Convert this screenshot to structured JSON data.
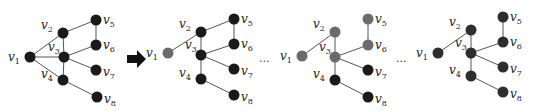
{
  "colors": {
    "black": "#1a1a1a",
    "dark": "#2e2e2e",
    "gray": "#6b6b6b",
    "edge": "#555555"
  },
  "labels": {
    "v1": "1",
    "v2": "2",
    "v3": "3",
    "v4": "4",
    "v5": "5",
    "v6": "6",
    "v7": "7",
    "v8": "8",
    "base": "v"
  },
  "ellipsis": [
    "...",
    "..."
  ],
  "arrow": "right-arrow",
  "panels": [
    {
      "name": "initial-graph",
      "nodes": {
        "v1": {
          "x": 30,
          "y": 57,
          "c": "black"
        },
        "v2": {
          "x": 63,
          "y": 33,
          "c": "black"
        },
        "v3": {
          "x": 64,
          "y": 57,
          "c": "black"
        },
        "v4": {
          "x": 63,
          "y": 80,
          "c": "black"
        },
        "v5": {
          "x": 96,
          "y": 20,
          "c": "black"
        },
        "v6": {
          "x": 96,
          "y": 45,
          "c": "black"
        },
        "v7": {
          "x": 96,
          "y": 70,
          "c": "black"
        },
        "v8": {
          "x": 97,
          "y": 97,
          "c": "black"
        }
      },
      "edges": [
        [
          "v1",
          "v2"
        ],
        [
          "v1",
          "v3"
        ],
        [
          "v1",
          "v4"
        ],
        [
          "v2",
          "v5"
        ],
        [
          "v2",
          "v3"
        ],
        [
          "v3",
          "v6"
        ],
        [
          "v5",
          "v6"
        ],
        [
          "v3",
          "v7"
        ],
        [
          "v3",
          "v4"
        ],
        [
          "v4",
          "v8"
        ]
      ]
    },
    {
      "name": "tree-step-1",
      "nodes": {
        "v1": {
          "x": 168,
          "y": 53,
          "c": "gray"
        },
        "v2": {
          "x": 201,
          "y": 32,
          "c": "black"
        },
        "v3": {
          "x": 201,
          "y": 55,
          "c": "black"
        },
        "v4": {
          "x": 201,
          "y": 79,
          "c": "black"
        },
        "v5": {
          "x": 234,
          "y": 19,
          "c": "black"
        },
        "v6": {
          "x": 234,
          "y": 44,
          "c": "black"
        },
        "v7": {
          "x": 234,
          "y": 69,
          "c": "black"
        },
        "v8": {
          "x": 234,
          "y": 95,
          "c": "black"
        }
      },
      "edges": [
        [
          "v1",
          "v2"
        ],
        [
          "v2",
          "v5"
        ],
        [
          "v2",
          "v3"
        ],
        [
          "v3",
          "v6"
        ],
        [
          "v5",
          "v6"
        ],
        [
          "v3",
          "v7"
        ],
        [
          "v3",
          "v4"
        ],
        [
          "v4",
          "v8"
        ]
      ]
    },
    {
      "name": "tree-step-k",
      "nodes": {
        "v1": {
          "x": 302,
          "y": 56,
          "c": "gray"
        },
        "v2": {
          "x": 335,
          "y": 32,
          "c": "gray"
        },
        "v3": {
          "x": 335,
          "y": 57,
          "c": "gray"
        },
        "v4": {
          "x": 335,
          "y": 80,
          "c": "black"
        },
        "v5": {
          "x": 368,
          "y": 19,
          "c": "gray"
        },
        "v6": {
          "x": 368,
          "y": 45,
          "c": "gray"
        },
        "v7": {
          "x": 368,
          "y": 70,
          "c": "black"
        },
        "v8": {
          "x": 368,
          "y": 97,
          "c": "black"
        }
      },
      "edges": [
        [
          "v1",
          "v2"
        ],
        [
          "v2",
          "v3"
        ],
        [
          "v3",
          "v6"
        ],
        [
          "v5",
          "v6"
        ],
        [
          "v3",
          "v7"
        ],
        [
          "v3",
          "v4"
        ],
        [
          "v4",
          "v8"
        ]
      ]
    },
    {
      "name": "spanning-tree",
      "nodes": {
        "v1": {
          "x": 438,
          "y": 53,
          "c": "dark"
        },
        "v2": {
          "x": 471,
          "y": 30,
          "c": "dark"
        },
        "v3": {
          "x": 471,
          "y": 53,
          "c": "dark"
        },
        "v4": {
          "x": 471,
          "y": 76,
          "c": "dark"
        },
        "v5": {
          "x": 503,
          "y": 17,
          "c": "dark"
        },
        "v6": {
          "x": 503,
          "y": 42,
          "c": "dark"
        },
        "v7": {
          "x": 503,
          "y": 67,
          "c": "dark"
        },
        "v8": {
          "x": 503,
          "y": 92,
          "c": "dark"
        }
      },
      "edges": [
        [
          "v1",
          "v2"
        ],
        [
          "v2",
          "v3"
        ],
        [
          "v3",
          "v6"
        ],
        [
          "v5",
          "v6"
        ],
        [
          "v3",
          "v7"
        ],
        [
          "v3",
          "v4"
        ],
        [
          "v4",
          "v8"
        ]
      ]
    }
  ]
}
